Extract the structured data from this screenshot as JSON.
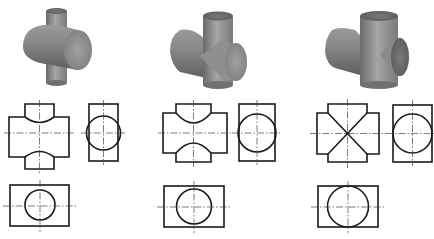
{
  "figure": {
    "colors": {
      "line": "#1a1a1a",
      "centerline": "#444444",
      "solid_light": "#bdbdbd",
      "solid_mid": "#8e8e8e",
      "solid_dark": "#5e5e5e",
      "background": "#ffffff"
    },
    "cases": [
      {
        "id": "case-1",
        "relation": "vertical cylinder smaller than horizontal cylinder",
        "front_view": "curved intersection lines bulging toward horizontal axis",
        "side_view": "circle inside rectangle",
        "top_view": "small circle inside rectangle"
      },
      {
        "id": "case-2",
        "relation": "vertical cylinder slightly smaller than horizontal cylinder",
        "front_view": "deeper curved intersection lines",
        "side_view": "circle inside rectangle",
        "top_view": "larger circle inside rectangle"
      },
      {
        "id": "case-3",
        "relation": "equal diameters",
        "front_view": "straight X-shaped intersection lines",
        "side_view": "circle tangent to rectangle sides",
        "top_view": "circle tangent to rectangle top and bottom"
      }
    ]
  }
}
